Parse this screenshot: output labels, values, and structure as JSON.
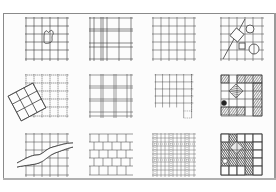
{
  "figure": {
    "title": "",
    "rows": 3,
    "cols": 4,
    "panels": [
      {
        "id": "p1",
        "row": 0,
        "col": 0,
        "kind": "grid-with-irregular-shape",
        "label": "Regular grid with organic figure"
      },
      {
        "id": "p2",
        "row": 0,
        "col": 1,
        "kind": "tartan-grid",
        "label": "Tartan grid"
      },
      {
        "id": "p3",
        "row": 0,
        "col": 2,
        "kind": "regular-grid",
        "label": "Regular square grid"
      },
      {
        "id": "p4",
        "row": 0,
        "col": 3,
        "kind": "grid-with-overlay-shapes",
        "label": "Grid with diagonal line, rotated square and circles"
      },
      {
        "id": "p5",
        "row": 1,
        "col": 0,
        "kind": "rotated-grid-overlap",
        "label": "Grid overlapped by rotated grid"
      },
      {
        "id": "p6",
        "row": 1,
        "col": 1,
        "kind": "double-line-grid",
        "label": "Grid with doubled lines"
      },
      {
        "id": "p7",
        "row": 1,
        "col": 2,
        "kind": "extended-grid",
        "label": "Grid with extension"
      },
      {
        "id": "p8",
        "row": 1,
        "col": 3,
        "kind": "filled-grid-frame",
        "label": "Grid with hatched border cells and rotated square"
      },
      {
        "id": "p9",
        "row": 2,
        "col": 0,
        "kind": "grid-with-river",
        "label": "Grid cut by meandering band"
      },
      {
        "id": "p10",
        "row": 2,
        "col": 1,
        "kind": "staggered-grid",
        "label": "Staggered / brick grid"
      },
      {
        "id": "p11",
        "row": 2,
        "col": 2,
        "kind": "dense-overlapping-grid",
        "label": "Dense overlapping sketch grid"
      },
      {
        "id": "p12",
        "row": 2,
        "col": 3,
        "kind": "dark-filled-grid",
        "label": "Mostly filled grid with white border cells"
      }
    ]
  },
  "colors": {
    "ink": "#3a3a3a",
    "light_ink": "#7a7a7a",
    "hatch": "#555555",
    "paper": "#fcfcfc",
    "frame": "#8a8a8a"
  }
}
